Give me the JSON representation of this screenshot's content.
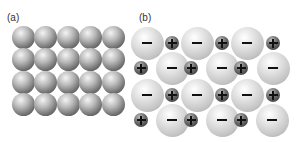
{
  "panels": [
    {
      "label": "(a)",
      "description": "metallic lattice of identical atoms",
      "rows": 4,
      "cols": 5
    },
    {
      "label": "(b)",
      "description": "ionic lattice of alternating anions and cations",
      "anion_symbol": "−",
      "cation_symbol": "+"
    }
  ],
  "layout": {
    "a": {
      "x0": 23,
      "y0": 37,
      "dx": 22.5,
      "dy": 22.5,
      "d": 23
    },
    "b": {
      "large_d": 33,
      "small_d": 14,
      "rows": [
        {
          "y": 43,
          "large": [
            147,
            197,
            247
          ],
          "small": [
            172,
            222,
            273
          ]
        },
        {
          "y": 68,
          "large": [
            172,
            222,
            273
          ],
          "small": [
            141,
            191,
            241
          ]
        },
        {
          "y": 95,
          "large": [
            147,
            197,
            247
          ],
          "small": [
            172,
            222,
            273
          ]
        },
        {
          "y": 120,
          "large": [
            172,
            222,
            272
          ],
          "small": [
            141,
            191,
            241
          ]
        }
      ]
    }
  }
}
